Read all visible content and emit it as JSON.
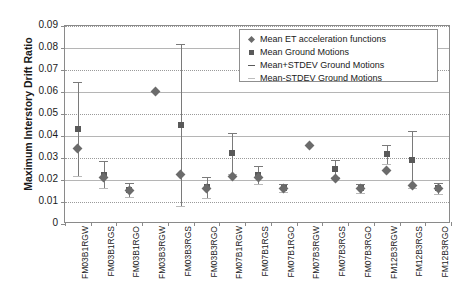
{
  "chart_data": {
    "type": "scatter",
    "title": "",
    "xlabel": "",
    "ylabel": "Maximum Interstory Drift Ratio",
    "ylim": [
      0,
      0.09
    ],
    "yticks": [
      "0",
      "0.01",
      "0.02",
      "0.03",
      "0.04",
      "0.05",
      "0.06",
      "0.07",
      "0.08",
      "0.09"
    ],
    "grid": true,
    "legend_position": "top-right",
    "categories": [
      "FM03B1RGW",
      "FM03B1RGS",
      "FM03B1RGO",
      "FM03B3RGW",
      "FM03B3RGS",
      "FM03B3RGO",
      "FM07B1RGW",
      "FM07B1RGS",
      "FM07B1RGO",
      "FM07B3RGW",
      "FM07B3RGS",
      "FM07B3RGO",
      "FM12B3RGW",
      "FM12B3RGS",
      "FM12B3RGO"
    ],
    "series": [
      {
        "name": "Mean ET acceleration functions",
        "marker": "diamond",
        "color": "#6b6b6b",
        "values": [
          0.0345,
          0.0213,
          0.0153,
          0.0601,
          0.0225,
          0.0163,
          0.0215,
          0.021,
          0.0163,
          0.0357,
          0.0205,
          0.016,
          0.0243,
          0.0177,
          0.016
        ]
      },
      {
        "name": "Mean Ground Motions",
        "marker": "square",
        "color": "#595959",
        "values": [
          0.0432,
          0.0225,
          0.0153,
          null,
          0.0449,
          0.0167,
          0.0322,
          0.0222,
          0.0163,
          null,
          0.0252,
          0.0163,
          0.0317,
          0.0293,
          0.0162
        ]
      },
      {
        "name": "Mean+STDEV Ground Motions",
        "marker": "dash",
        "color": "#5a5a5a",
        "values": [
          0.0645,
          0.0287,
          0.0186,
          null,
          0.0818,
          0.0215,
          0.0415,
          0.0262,
          0.0182,
          null,
          0.0292,
          0.0184,
          0.036,
          0.0422,
          0.0188
        ]
      },
      {
        "name": "Mean-STDEV Ground Motions",
        "marker": "dash-light",
        "color": "#bdbdbd",
        "values": [
          0.0218,
          0.0163,
          0.0123,
          null,
          0.008,
          0.012,
          0.0228,
          0.0182,
          0.0145,
          null,
          0.0212,
          0.0142,
          0.0274,
          0.0164,
          0.0136
        ]
      }
    ]
  },
  "legend": {
    "items": [
      {
        "label": "Mean ET acceleration functions",
        "marker": "diamond"
      },
      {
        "label": "Mean Ground Motions",
        "marker": "square"
      },
      {
        "label": "Mean+STDEV Ground Motions",
        "marker": "dash"
      },
      {
        "label": "Mean-STDEV Ground Motions",
        "marker": "dash-light"
      }
    ]
  },
  "axis": {
    "y_title": "Maximum Interstory Drift Ratio"
  }
}
